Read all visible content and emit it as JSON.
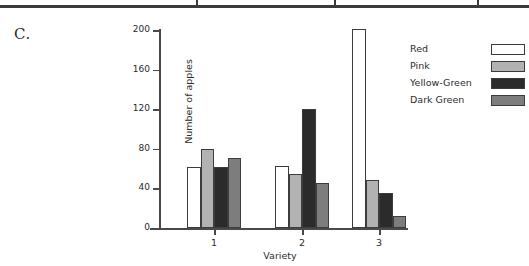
{
  "panel": {
    "label": "C."
  },
  "top_rule": {
    "dividers_x": [
      196,
      334,
      477
    ]
  },
  "legend": {
    "entries": [
      {
        "label": "Red",
        "color": "#ffffff"
      },
      {
        "label": "Pink",
        "color": "#b2b2b2"
      },
      {
        "label": "Yellow-Green",
        "color": "#2b2b2b"
      },
      {
        "label": "Dark Green",
        "color": "#7d7d7d"
      }
    ]
  },
  "chart_data": {
    "type": "bar",
    "title": "",
    "xlabel": "Variety",
    "ylabel": "Number of apples",
    "categories": [
      "1",
      "2",
      "3"
    ],
    "series": [
      {
        "name": "Red",
        "color": "#ffffff",
        "values": [
          62,
          63,
          201
        ]
      },
      {
        "name": "Pink",
        "color": "#b2b2b2",
        "values": [
          80,
          55,
          49
        ]
      },
      {
        "name": "Yellow-Green",
        "color": "#2b2b2b",
        "values": [
          62,
          120,
          35
        ]
      },
      {
        "name": "Dark Green",
        "color": "#7d7d7d",
        "values": [
          71,
          45,
          12
        ]
      }
    ],
    "ylim": [
      0,
      200
    ],
    "yticks": [
      0,
      40,
      80,
      120,
      160,
      200
    ],
    "grid": false,
    "legend_position": "right"
  }
}
